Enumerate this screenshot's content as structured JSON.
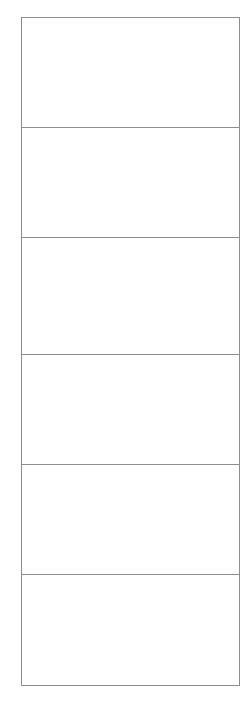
{
  "page": {
    "background_color": "#ffffff",
    "width": 249,
    "height": 701
  },
  "table": {
    "border_color": "#8d8d8d",
    "fill_color": "#ffffff",
    "border_width_px": 1,
    "row_count": 6,
    "column_count": 1,
    "bounds": {
      "left": 21,
      "top": 17,
      "width": 219,
      "height": 669
    },
    "rows": [
      {
        "id": "row-1",
        "height": 110,
        "text": ""
      },
      {
        "id": "row-2",
        "height": 110,
        "text": ""
      },
      {
        "id": "row-3",
        "height": 117,
        "text": ""
      },
      {
        "id": "row-4",
        "height": 110,
        "text": ""
      },
      {
        "id": "row-5",
        "height": 110,
        "text": ""
      },
      {
        "id": "row-6",
        "height": 112,
        "text": ""
      }
    ]
  }
}
